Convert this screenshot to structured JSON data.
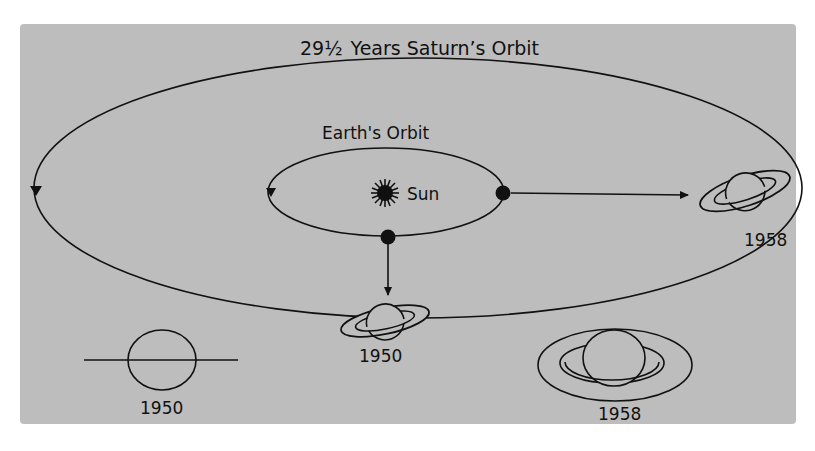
{
  "diagram": {
    "colors": {
      "background": "#ffffff",
      "panel": "#bdbdbd",
      "ink": "#111111"
    },
    "saturn_orbit": {
      "label": "29½ Years  Saturn's Orbit",
      "period_years": "29½",
      "direction_arrow": "downward on left side"
    },
    "earth_orbit": {
      "label": "Earth's Orbit",
      "direction_arrow": "downward on left side"
    },
    "sun": {
      "label": "Sun",
      "icon": "sun-icon"
    },
    "positions": [
      {
        "year": "1950",
        "earth_position": "bottom of Earth's orbit",
        "saturn_position": "bottom of Saturn's orbit",
        "label": "1950"
      },
      {
        "year": "1958",
        "earth_position": "right of Earth's orbit",
        "saturn_position": "right of Saturn's orbit",
        "label": "1958"
      }
    ],
    "ring_views": [
      {
        "label": "1950",
        "description": "rings edge-on, appearing as a line through the globe"
      },
      {
        "label": "1958",
        "description": "rings wide open, seen as ellipse around globe"
      }
    ]
  }
}
